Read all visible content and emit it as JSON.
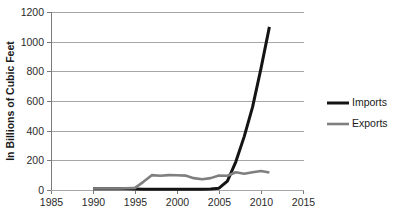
{
  "chart_data": {
    "type": "line",
    "title": "",
    "xlabel": "",
    "ylabel": "In Billions of Cubic Feet",
    "xlim": [
      1985,
      2015
    ],
    "ylim": [
      0,
      1200
    ],
    "grid": true,
    "legend_position": "right",
    "x_ticks": [
      1985,
      1990,
      1995,
      2000,
      2005,
      2010,
      2015
    ],
    "x_tick_labels": [
      "1985",
      "1990",
      "1995",
      "2000",
      "2005",
      "2010",
      "2015"
    ],
    "y_ticks": [
      0,
      200,
      400,
      600,
      800,
      1000,
      1200
    ],
    "y_tick_labels": [
      "0",
      "200",
      "400",
      "600",
      "800",
      "1000",
      "1200"
    ],
    "series": [
      {
        "name": "Imports",
        "color": "#141414",
        "width": 3.0,
        "x": [
          1990,
          1991,
          1992,
          1993,
          1994,
          1995,
          1996,
          1997,
          1998,
          1999,
          2000,
          2001,
          2002,
          2003,
          2004,
          2005,
          2006,
          2007,
          2008,
          2009,
          2010,
          2011
        ],
        "values": [
          8,
          8,
          8,
          8,
          8,
          6,
          5,
          5,
          5,
          5,
          5,
          5,
          5,
          5,
          6,
          12,
          60,
          190,
          360,
          560,
          820,
          1100
        ]
      },
      {
        "name": "Exports",
        "color": "#7f7f7f",
        "width": 2.6,
        "x": [
          1990,
          1991,
          1992,
          1993,
          1994,
          1995,
          1996,
          1997,
          1998,
          1999,
          2000,
          2001,
          2002,
          2003,
          2004,
          2005,
          2006,
          2007,
          2008,
          2009,
          2010,
          2011
        ],
        "values": [
          10,
          10,
          10,
          10,
          12,
          14,
          55,
          100,
          96,
          100,
          99,
          97,
          80,
          72,
          80,
          98,
          96,
          120,
          110,
          120,
          128,
          118
        ]
      }
    ],
    "legend": [
      {
        "label": "Imports",
        "color": "#141414",
        "width": 3.0
      },
      {
        "label": "Exports",
        "color": "#7f7f7f",
        "width": 2.6
      }
    ]
  },
  "plot_geometry": {
    "left": 51,
    "right": 303,
    "top": 12,
    "bottom": 190
  }
}
